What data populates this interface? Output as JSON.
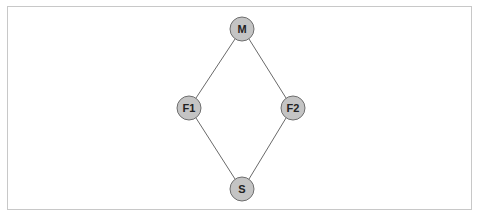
{
  "diagram": {
    "type": "graph",
    "nodes": [
      {
        "id": "M",
        "label": "M",
        "cx": 242,
        "cy": 29
      },
      {
        "id": "F1",
        "label": "F1",
        "cx": 189,
        "cy": 108
      },
      {
        "id": "F2",
        "label": "F2",
        "cx": 293,
        "cy": 108
      },
      {
        "id": "S",
        "label": "S",
        "cx": 242,
        "cy": 189
      }
    ],
    "edges": [
      {
        "from": "M",
        "to": "F1"
      },
      {
        "from": "M",
        "to": "F2"
      },
      {
        "from": "F1",
        "to": "S"
      },
      {
        "from": "F2",
        "to": "S"
      }
    ],
    "colors": {
      "node_fill": "#c4c4c4",
      "node_stroke": "#6e6e6e",
      "edge": "#6a6a6a",
      "frame": "#c8c8c8"
    }
  }
}
